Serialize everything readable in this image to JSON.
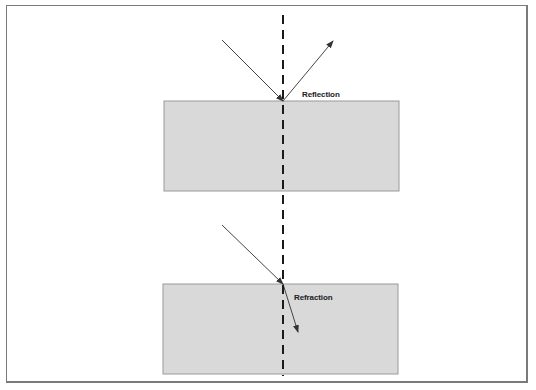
{
  "diagram": {
    "title": "",
    "colors": {
      "frame_border": "#7a7a7a",
      "block_fill": "#d9d9d9",
      "block_stroke": "#9a9a9a",
      "ray": "#444444",
      "normal_line": "#1a1a1a"
    },
    "normal_line": {
      "x": 283,
      "y1": 15,
      "y2": 376,
      "style": "dashed"
    },
    "panels": [
      {
        "id": "reflection",
        "label": "Reflection",
        "label_pos": {
          "x": 302,
          "y": 97
        },
        "block": {
          "x": 164,
          "y": 101,
          "width": 235,
          "height": 90
        },
        "incident_ray": {
          "x1": 222,
          "y1": 40,
          "x2": 283,
          "y2": 101
        },
        "outgoing_ray": {
          "x1": 283,
          "y1": 101,
          "x2": 333,
          "y2": 41,
          "type": "reflected"
        }
      },
      {
        "id": "refraction",
        "label": "Refraction",
        "label_pos": {
          "x": 294,
          "y": 300
        },
        "block": {
          "x": 163,
          "y": 284,
          "width": 235,
          "height": 90
        },
        "incident_ray": {
          "x1": 222,
          "y1": 225,
          "x2": 283,
          "y2": 284
        },
        "outgoing_ray": {
          "x1": 283,
          "y1": 284,
          "x2": 298,
          "y2": 332,
          "type": "refracted"
        }
      }
    ]
  }
}
